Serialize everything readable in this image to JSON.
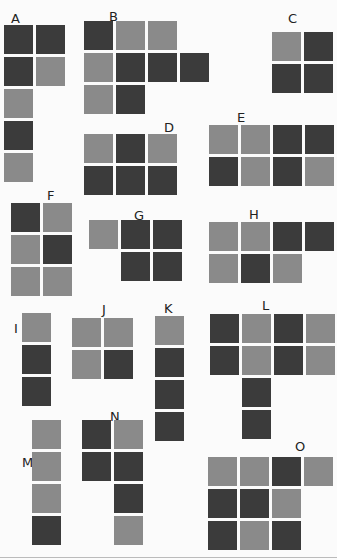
{
  "diagram": {
    "type": "polyomino-pieces",
    "cell_size": 29,
    "cell_pitch": 32,
    "colors": {
      "dark": "#3b3b3b",
      "light": "#8a8a8a"
    },
    "pieces": [
      {
        "label": "A",
        "label_pos": [
          11,
          12
        ],
        "origin": [
          4,
          25
        ],
        "rows": [
          [
            "D",
            "D"
          ],
          [
            "D",
            "L"
          ],
          [
            "L"
          ],
          [
            "D"
          ],
          [
            "L"
          ]
        ]
      },
      {
        "label": "B",
        "label_pos": [
          109,
          10
        ],
        "origin": [
          84,
          21
        ],
        "rows": [
          [
            "D",
            "L",
            "L"
          ],
          [
            "L",
            "D",
            "D",
            "D"
          ],
          [
            "L",
            "D"
          ]
        ]
      },
      {
        "label": "C",
        "label_pos": [
          288,
          12
        ],
        "origin": [
          272,
          32
        ],
        "rows": [
          [
            "L",
            "D"
          ],
          [
            "D",
            "D"
          ]
        ]
      },
      {
        "label": "D",
        "label_pos": [
          164,
          121
        ],
        "origin": [
          84,
          134
        ],
        "rows": [
          [
            "L",
            "D",
            "L"
          ],
          [
            "D",
            "D",
            "D"
          ]
        ]
      },
      {
        "label": "E",
        "label_pos": [
          237,
          111
        ],
        "origin": [
          209,
          125
        ],
        "rows": [
          [
            "L",
            "L",
            "D",
            "D"
          ],
          [
            "D",
            "L",
            "D",
            "L"
          ]
        ]
      },
      {
        "label": "F",
        "label_pos": [
          47,
          189
        ],
        "origin": [
          11,
          203
        ],
        "rows": [
          [
            "D",
            "L"
          ],
          [
            "L",
            "D"
          ],
          [
            "L",
            "L"
          ]
        ]
      },
      {
        "label": "G",
        "label_pos": [
          134,
          209
        ],
        "origin": [
          89,
          220
        ],
        "rows": [
          [
            "L",
            "D",
            "D"
          ],
          [
            null,
            "D",
            "D"
          ]
        ]
      },
      {
        "label": "H",
        "label_pos": [
          249,
          208
        ],
        "origin": [
          209,
          222
        ],
        "rows": [
          [
            "L",
            "L",
            "D",
            "D"
          ],
          [
            "L",
            "D",
            "L"
          ]
        ]
      },
      {
        "label": "I",
        "label_pos": [
          14,
          322
        ],
        "origin": [
          22,
          313
        ],
        "rows": [
          [
            "L"
          ],
          [
            "D"
          ],
          [
            "D"
          ]
        ]
      },
      {
        "label": "J",
        "label_pos": [
          102,
          303
        ],
        "origin": [
          72,
          318
        ],
        "rows": [
          [
            "L",
            "L"
          ],
          [
            "L",
            "D"
          ]
        ]
      },
      {
        "label": "K",
        "label_pos": [
          164,
          302
        ],
        "origin": [
          155,
          316
        ],
        "rows": [
          [
            "L"
          ],
          [
            "D"
          ],
          [
            "D"
          ],
          [
            "D"
          ]
        ]
      },
      {
        "label": "L",
        "label_pos": [
          262,
          299
        ],
        "origin": [
          210,
          314
        ],
        "rows": [
          [
            "D",
            "L",
            "D",
            "L"
          ],
          [
            "D",
            "L",
            "D",
            "L"
          ],
          [
            null,
            "D"
          ],
          [
            null,
            "D"
          ]
        ]
      },
      {
        "label": "M",
        "label_pos": [
          22,
          456
        ],
        "origin": [
          32,
          420
        ],
        "rows": [
          [
            "L"
          ],
          [
            "L"
          ],
          [
            "L"
          ],
          [
            "D"
          ]
        ]
      },
      {
        "label": "N",
        "label_pos": [
          110,
          410
        ],
        "origin": [
          82,
          420
        ],
        "rows": [
          [
            "D",
            "L"
          ],
          [
            "D",
            "D"
          ],
          [
            null,
            "D"
          ],
          [
            null,
            "L"
          ]
        ]
      },
      {
        "label": "O",
        "label_pos": [
          295,
          440
        ],
        "origin": [
          208,
          457
        ],
        "rows": [
          [
            "L",
            "L",
            "D",
            "L"
          ],
          [
            "D",
            "D",
            "L"
          ],
          [
            "D",
            "L",
            "D"
          ]
        ]
      }
    ]
  }
}
